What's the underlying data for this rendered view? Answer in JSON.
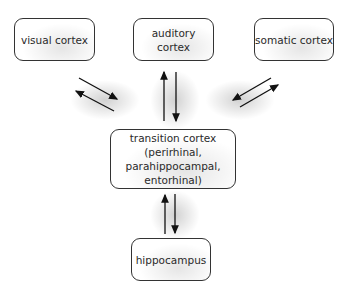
{
  "diagram": {
    "nodes": [
      {
        "id": "visual",
        "label": "visual cortex"
      },
      {
        "id": "auditory",
        "label": "auditory cortex"
      },
      {
        "id": "somatic",
        "label": "somatic cortex"
      },
      {
        "id": "transition",
        "label_lines": [
          "transition cortex",
          "(perirhinal, parahippocampal,",
          "entorhinal)"
        ]
      },
      {
        "id": "hippocampus",
        "label": "hippocampus"
      }
    ],
    "edges": [
      {
        "from": "visual",
        "to": "transition",
        "bidirectional": true
      },
      {
        "from": "auditory",
        "to": "transition",
        "bidirectional": true
      },
      {
        "from": "somatic",
        "to": "transition",
        "bidirectional": true
      },
      {
        "from": "transition",
        "to": "hippocampus",
        "bidirectional": true
      }
    ]
  }
}
